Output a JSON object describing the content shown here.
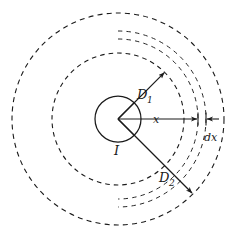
{
  "figure": {
    "type": "physics-diagram",
    "background_color": "#ffffff",
    "stroke_color": "#1a1a1a",
    "center": {
      "x": 118,
      "y": 119
    },
    "labels": [
      {
        "id": "D1",
        "base": "D",
        "sub": "1",
        "x": 137,
        "y": 99,
        "size": "main"
      },
      {
        "id": "I",
        "base": "I",
        "sub": "",
        "x": 114,
        "y": 155,
        "size": "main"
      },
      {
        "id": "D2",
        "base": "D",
        "sub": "2",
        "x": 159,
        "y": 182,
        "size": "main"
      },
      {
        "id": "x",
        "base": "x",
        "sub": "",
        "x": 153,
        "y": 124,
        "size": "small"
      },
      {
        "id": "dx",
        "base": "dx",
        "sub": "",
        "x": 205,
        "y": 141,
        "size": "small"
      }
    ],
    "circles": [
      {
        "id": "conductor",
        "radius": 23,
        "style": "solid",
        "label": "I"
      },
      {
        "id": "shell-mid",
        "radius": 66,
        "style": "dashed",
        "label": "D1-circle"
      },
      {
        "id": "shell-inner-dx",
        "radius": 80,
        "style": "dashed-fine",
        "label": "x-circle"
      },
      {
        "id": "shell-outer-dx",
        "radius": 88,
        "style": "dashed-fine",
        "label": "x-plus-dx-circle"
      },
      {
        "id": "shell-outer",
        "radius": 106,
        "style": "dashed",
        "label": "D2-circle"
      }
    ],
    "arrows": [
      {
        "id": "D1-arrow",
        "from_radius": 23,
        "to_radius": 66,
        "angle_deg": -45,
        "head": "end"
      },
      {
        "id": "D2-arrow",
        "from_radius": 23,
        "to_radius": 106,
        "angle_deg": 45,
        "head": "end"
      },
      {
        "id": "x-arrow",
        "from_radius": 0,
        "to_radius": 80,
        "angle_deg": 0,
        "head": "end"
      },
      {
        "id": "dx-arrow",
        "from_radius": 80,
        "to_radius": 88,
        "angle_deg": 0,
        "head": "both"
      }
    ]
  }
}
